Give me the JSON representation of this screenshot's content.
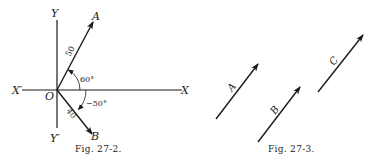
{
  "figures": [
    {
      "caption": "Fig. 27-2.",
      "axes": {
        "x": "X",
        "x_neg": "X′",
        "y": "Y",
        "y_neg": "Y′",
        "origin": "O"
      },
      "vectors": [
        {
          "name": "A",
          "magnitude": "50",
          "angle": "60°"
        },
        {
          "name": "B",
          "magnitude": "40",
          "angle": "−50°"
        }
      ]
    },
    {
      "caption": "Fig. 27-3.",
      "vectors": [
        {
          "name": "A"
        },
        {
          "name": "B"
        },
        {
          "name": "C"
        }
      ]
    }
  ]
}
